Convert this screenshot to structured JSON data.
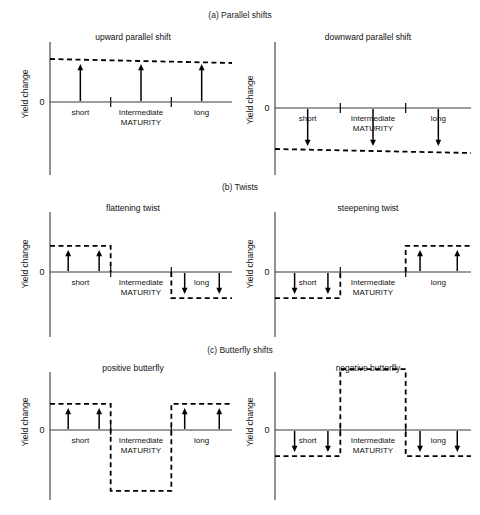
{
  "figure": {
    "width": 480,
    "height": 515,
    "background": "#ffffff",
    "ink": "#000000"
  },
  "sections": [
    {
      "id": "a",
      "label": "(a) Parallel shifts",
      "x": 240,
      "y": 18
    },
    {
      "id": "b",
      "label": "(b) Twists",
      "x": 240,
      "y": 190
    },
    {
      "id": "c",
      "label": "(c) Butterfly shifts",
      "x": 240,
      "y": 353
    }
  ],
  "common": {
    "ylabel": "Yield change",
    "zero_label": "0",
    "categories": [
      "short",
      "Intermediate",
      "long"
    ],
    "maturity_label": "MATURITY",
    "xlabel_stack": [
      "Intermediate",
      "MATURITY"
    ]
  },
  "chart_data": [
    {
      "id": "upward-parallel-shift",
      "type": "bar",
      "title": "upward parallel shift",
      "ylabel": "Yield change",
      "xlabel": "MATURITY",
      "categories": [
        "short",
        "Intermediate",
        "long"
      ],
      "values": [
        1,
        1,
        1
      ],
      "ylim": [
        -1.6,
        1.6
      ],
      "shape": "flat",
      "level": 1,
      "arrows": [
        {
          "category": "short",
          "direction": "up",
          "from": 0,
          "to": 1
        },
        {
          "category": "Intermediate",
          "direction": "up",
          "from": 0,
          "to": 1
        },
        {
          "category": "long",
          "direction": "up",
          "from": 0,
          "to": 1
        }
      ],
      "annotation": "Entire yield curve shifts up by an equal amount at all maturities."
    },
    {
      "id": "downward-parallel-shift",
      "type": "bar",
      "title": "downward parallel shift",
      "ylabel": "Yield change",
      "xlabel": "MATURITY",
      "categories": [
        "short",
        "Intermediate",
        "long"
      ],
      "values": [
        -1,
        -1,
        -1
      ],
      "ylim": [
        -1.6,
        1.6
      ],
      "shape": "flat",
      "level": -1,
      "arrows": [
        {
          "category": "short",
          "direction": "down",
          "from": 0,
          "to": -1
        },
        {
          "category": "Intermediate",
          "direction": "down",
          "from": 0,
          "to": -1
        },
        {
          "category": "long",
          "direction": "down",
          "from": 0,
          "to": -1
        }
      ],
      "annotation": "Entire yield curve shifts down by an equal amount at all maturities."
    },
    {
      "id": "flattening-twist",
      "type": "bar",
      "title": "flattening twist",
      "ylabel": "Yield change",
      "xlabel": "MATURITY",
      "categories": [
        "short",
        "Intermediate",
        "long"
      ],
      "values": [
        0.62,
        0,
        -0.62
      ],
      "ylim": [
        -1.6,
        1.6
      ],
      "shape": "step",
      "arrows": [
        {
          "category": "short",
          "direction": "up",
          "from": 0,
          "to": 0.62
        },
        {
          "category": "short",
          "direction": "up",
          "from": 0,
          "to": 0.62
        },
        {
          "category": "long",
          "direction": "down",
          "from": 0,
          "to": -0.62
        },
        {
          "category": "long",
          "direction": "down",
          "from": 0,
          "to": -0.62
        }
      ],
      "annotation": "Short rates rise, long rates fall: the curve flattens."
    },
    {
      "id": "steepening-twist",
      "type": "bar",
      "title": "steepening twist",
      "ylabel": "Yield change",
      "xlabel": "MATURITY",
      "categories": [
        "short",
        "Intermediate",
        "long"
      ],
      "values": [
        -0.62,
        0,
        0.62
      ],
      "ylim": [
        -1.6,
        1.6
      ],
      "shape": "step",
      "arrows": [
        {
          "category": "short",
          "direction": "down",
          "from": 0,
          "to": -0.62
        },
        {
          "category": "short",
          "direction": "down",
          "from": 0,
          "to": -0.62
        },
        {
          "category": "long",
          "direction": "up",
          "from": 0,
          "to": 0.62
        },
        {
          "category": "long",
          "direction": "up",
          "from": 0,
          "to": 0.62
        }
      ],
      "annotation": "Short rates fall, long rates rise: the curve steepens."
    },
    {
      "id": "positive-butterfly",
      "type": "bar",
      "title": "positive butterfly",
      "ylabel": "Yield change",
      "xlabel": "MATURITY",
      "categories": [
        "short",
        "Intermediate",
        "long"
      ],
      "values": [
        0.62,
        -1.45,
        0.62
      ],
      "ylim": [
        -1.6,
        1.6
      ],
      "shape": "butterfly",
      "arrows": [
        {
          "category": "short",
          "direction": "up",
          "from": 0,
          "to": 0.62
        },
        {
          "category": "short",
          "direction": "up",
          "from": 0,
          "to": 0.62
        },
        {
          "category": "long",
          "direction": "up",
          "from": 0,
          "to": 0.62
        },
        {
          "category": "long",
          "direction": "up",
          "from": 0,
          "to": 0.62
        }
      ],
      "annotation": "Short and long rates rise while intermediate rates fall."
    },
    {
      "id": "negative-butterfly",
      "type": "bar",
      "title": "negative butterfly",
      "ylabel": "Yield change",
      "xlabel": "MATURITY",
      "categories": [
        "short",
        "Intermediate",
        "long"
      ],
      "values": [
        -0.62,
        1.45,
        -0.62
      ],
      "ylim": [
        -1.6,
        1.6
      ],
      "shape": "butterfly",
      "arrows": [
        {
          "category": "short",
          "direction": "down",
          "from": 0,
          "to": -0.62
        },
        {
          "category": "short",
          "direction": "down",
          "from": 0,
          "to": -0.62
        },
        {
          "category": "long",
          "direction": "down",
          "from": 0,
          "to": -0.62
        },
        {
          "category": "long",
          "direction": "down",
          "from": 0,
          "to": -0.62
        }
      ],
      "annotation": "Short and long rates fall while intermediate rates rise."
    }
  ],
  "panel_geometry": [
    {
      "id": "upward-parallel-shift",
      "ox": 50,
      "oy": 102,
      "w": 182,
      "top": 42,
      "bottom": 175,
      "title_x": 133,
      "title_y": 40
    },
    {
      "id": "downward-parallel-shift",
      "ox": 275,
      "oy": 108,
      "w": 196,
      "top": 42,
      "bottom": 175,
      "title_x": 368,
      "title_y": 40
    },
    {
      "id": "flattening-twist",
      "ox": 50,
      "oy": 272,
      "w": 182,
      "top": 212,
      "bottom": 337,
      "title_x": 133,
      "title_y": 211
    },
    {
      "id": "steepening-twist",
      "ox": 275,
      "oy": 272,
      "w": 196,
      "top": 212,
      "bottom": 337,
      "title_x": 368,
      "title_y": 211
    },
    {
      "id": "positive-butterfly",
      "ox": 50,
      "oy": 430,
      "w": 182,
      "top": 372,
      "bottom": 500,
      "title_x": 133,
      "title_y": 371
    },
    {
      "id": "negative-butterfly",
      "ox": 275,
      "oy": 430,
      "w": 196,
      "top": 372,
      "bottom": 500,
      "title_x": 368,
      "title_y": 371
    }
  ]
}
